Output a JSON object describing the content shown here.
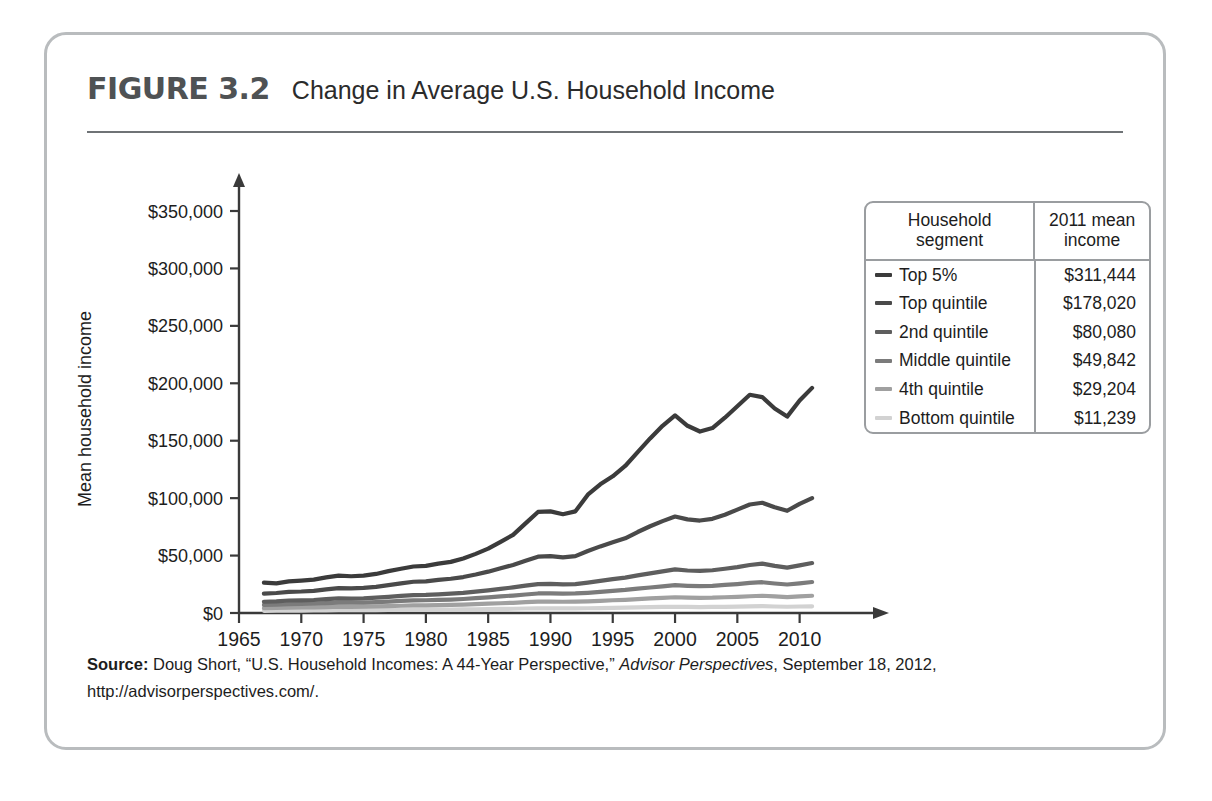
{
  "figure": {
    "number": "FIGURE 3.2",
    "title": "Change in Average U.S. Household Income"
  },
  "source": {
    "label": "Source:",
    "author": " Doug Short, “U.S. Household Incomes: A 44-Year Perspective,” ",
    "publication": "Advisor Perspectives",
    "date": ", September 18, 2012,",
    "url": "http://advisorperspectives.com/."
  },
  "legend": {
    "header": {
      "segment": "Household segment",
      "segment_line1": "Household",
      "segment_line2": "segment",
      "income": "2011 mean income",
      "income_line1": "2011 mean",
      "income_line2": "income"
    },
    "rows": [
      {
        "label": "Top 5%",
        "income": "$311,444",
        "color": "#3b3b3b"
      },
      {
        "label": "Top quintile",
        "income": "$178,020",
        "color": "#4a4a4a"
      },
      {
        "label": "2nd quintile",
        "income": "$80,080",
        "color": "#5e5e5e"
      },
      {
        "label": "Middle quintile",
        "income": "$49,842",
        "color": "#7b7b7b"
      },
      {
        "label": "4th quintile",
        "income": "$29,204",
        "color": "#a0a0a0"
      },
      {
        "label": "Bottom quintile",
        "income": "$11,239",
        "color": "#d2d2d2"
      }
    ]
  },
  "chart_data": {
    "type": "line",
    "title": "Change in Average U.S. Household Income",
    "xlabel": "Year",
    "ylabel": "Mean household income",
    "xlim": [
      1965,
      2013
    ],
    "ylim": [
      0,
      350000
    ],
    "grid": false,
    "legend_position": "right",
    "xticks": [
      1965,
      1970,
      1975,
      1980,
      1985,
      1990,
      1995,
      2000,
      2005,
      2010
    ],
    "xtick_labels": [
      "1965",
      "1970",
      "1975",
      "1980",
      "1985",
      "1990",
      "1995",
      "2000",
      "2005",
      "2010"
    ],
    "yticks": [
      0,
      50000,
      100000,
      150000,
      200000,
      250000,
      300000,
      350000
    ],
    "ytick_labels": [
      "$0",
      "$50,000",
      "$100,000",
      "$150,000",
      "$200,000",
      "$250,000",
      "$300,000",
      "$350,000"
    ],
    "x": [
      1967,
      1968,
      1969,
      1970,
      1971,
      1972,
      1973,
      1974,
      1975,
      1976,
      1977,
      1978,
      1979,
      1980,
      1981,
      1982,
      1983,
      1984,
      1985,
      1986,
      1987,
      1988,
      1989,
      1990,
      1991,
      1992,
      1993,
      1994,
      1995,
      1996,
      1997,
      1998,
      1999,
      2000,
      2001,
      2002,
      2003,
      2004,
      2005,
      2006,
      2007,
      2008,
      2009,
      2010,
      2011
    ],
    "series": [
      {
        "name": "Top 5%",
        "color": "#3b3b3b",
        "values": [
          26500,
          25800,
          27500,
          28200,
          29000,
          31000,
          32500,
          32000,
          32500,
          34000,
          36500,
          38500,
          40500,
          41000,
          43000,
          44500,
          47500,
          51500,
          56000,
          62000,
          68000,
          78000,
          88000,
          88500,
          86000,
          88500,
          103000,
          112000,
          119000,
          128000,
          140000,
          152000,
          163000,
          172000,
          163000,
          158000,
          161000,
          170000,
          180000,
          190000,
          188000,
          178000,
          171000,
          185000,
          196000
        ]
      },
      {
        "name": "Top quintile",
        "color": "#4a4a4a",
        "values": [
          16800,
          17400,
          18400,
          18700,
          19300,
          20500,
          21600,
          21500,
          21800,
          22800,
          24200,
          25800,
          27200,
          27600,
          28800,
          29800,
          31300,
          33500,
          36000,
          39000,
          41800,
          45500,
          49000,
          49500,
          48500,
          49500,
          54000,
          58000,
          61500,
          65000,
          70500,
          75500,
          80000,
          84000,
          81500,
          80500,
          82000,
          85500,
          90000,
          94500,
          96000,
          92000,
          89000,
          95000,
          100000
        ]
      },
      {
        "name": "2nd quintile",
        "color": "#5e5e5e",
        "values": [
          9800,
          10200,
          10900,
          11000,
          11300,
          12000,
          12700,
          12600,
          12800,
          13300,
          14000,
          14900,
          15600,
          15800,
          16300,
          16800,
          17500,
          18600,
          19700,
          21000,
          22300,
          23800,
          25200,
          25400,
          24900,
          25200,
          26500,
          28000,
          29500,
          30800,
          32700,
          34500,
          36300,
          38000,
          37000,
          36600,
          37200,
          38500,
          40000,
          41800,
          43000,
          41000,
          39500,
          41500,
          43500
        ]
      },
      {
        "name": "Middle quintile",
        "color": "#7b7b7b",
        "values": [
          7000,
          7300,
          7800,
          7900,
          8100,
          8600,
          9100,
          9000,
          9100,
          9400,
          9900,
          10500,
          11000,
          11100,
          11400,
          11700,
          12200,
          12900,
          13600,
          14400,
          15200,
          16100,
          17000,
          17100,
          16800,
          17000,
          17600,
          18400,
          19300,
          20100,
          21200,
          22200,
          23200,
          24200,
          23700,
          23400,
          23700,
          24400,
          25200,
          26200,
          26800,
          25700,
          24800,
          25800,
          27000
        ]
      },
      {
        "name": "4th quintile",
        "color": "#a0a0a0",
        "values": [
          4200,
          4400,
          4700,
          4800,
          4900,
          5200,
          5500,
          5400,
          5500,
          5700,
          6000,
          6300,
          6600,
          6650,
          6800,
          7000,
          7300,
          7700,
          8100,
          8500,
          8900,
          9400,
          9900,
          9950,
          9800,
          9900,
          10200,
          10600,
          11100,
          11500,
          12100,
          12700,
          13200,
          13700,
          13400,
          13200,
          13300,
          13700,
          14100,
          14600,
          15000,
          14400,
          13900,
          14400,
          15000
        ]
      },
      {
        "name": "Bottom quintile",
        "color": "#d2d2d2",
        "values": [
          1900,
          2000,
          2100,
          2150,
          2200,
          2300,
          2450,
          2400,
          2450,
          2500,
          2650,
          2800,
          2900,
          2900,
          2950,
          3000,
          3100,
          3250,
          3400,
          3550,
          3700,
          3900,
          4100,
          4100,
          4000,
          4050,
          4150,
          4300,
          4500,
          4650,
          4850,
          5050,
          5250,
          5400,
          5300,
          5200,
          5250,
          5400,
          5550,
          5750,
          5900,
          5650,
          5450,
          5650,
          5850
        ]
      }
    ]
  }
}
